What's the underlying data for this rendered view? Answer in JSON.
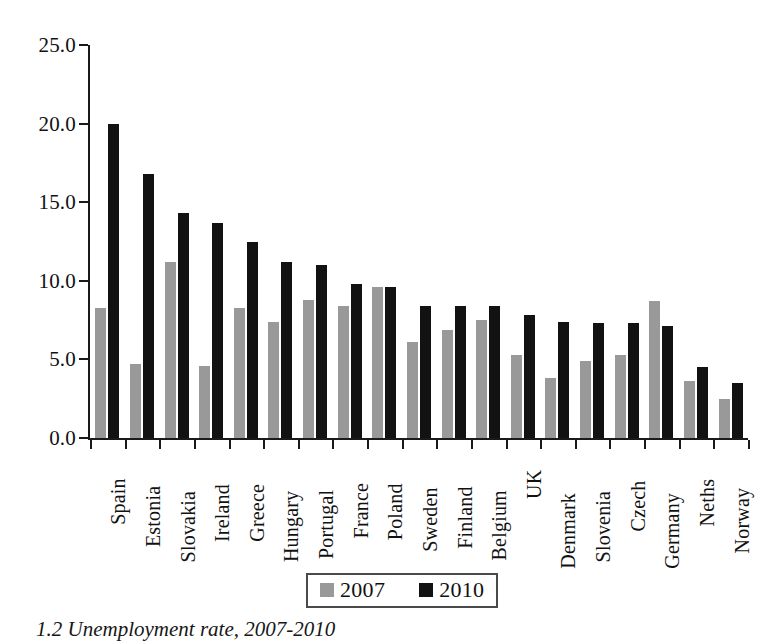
{
  "chart_data": {
    "type": "bar",
    "title": "",
    "xlabel": "",
    "ylabel": "",
    "ylim": [
      0.0,
      25.0
    ],
    "yticks": [
      "0.0",
      "5.0",
      "10.0",
      "15.0",
      "20.0",
      "25.0"
    ],
    "ytick_values": [
      0.0,
      5.0,
      10.0,
      15.0,
      20.0,
      25.0
    ],
    "grid": false,
    "legend_position": "bottom-center",
    "categories": [
      "Spain",
      "Estonia",
      "Slovakia",
      "Ireland",
      "Greece",
      "Hungary",
      "Portugal",
      "France",
      "Poland",
      "Sweden",
      "Finland",
      "Belgium",
      "UK",
      "Denmark",
      "Slovenia",
      "Czech",
      "Germany",
      "Neths",
      "Norway"
    ],
    "series": [
      {
        "name": "2007",
        "color": "#999999",
        "values": [
          8.3,
          4.7,
          11.2,
          4.6,
          8.3,
          7.4,
          8.8,
          8.4,
          9.6,
          6.1,
          6.9,
          7.5,
          5.3,
          3.8,
          4.9,
          5.3,
          8.7,
          3.6,
          2.5
        ]
      },
      {
        "name": "2010",
        "color": "#121212",
        "values": [
          20.0,
          16.8,
          14.3,
          13.7,
          12.5,
          11.2,
          11.0,
          9.8,
          9.6,
          8.4,
          8.4,
          8.4,
          7.8,
          7.4,
          7.3,
          7.3,
          7.1,
          4.5,
          3.5
        ]
      }
    ]
  },
  "legend": {
    "items": [
      {
        "label": "2007",
        "color": "#999999"
      },
      {
        "label": "2010",
        "color": "#121212"
      }
    ]
  },
  "caption": {
    "text": "1.2  Unemployment rate, 2007-2010"
  }
}
